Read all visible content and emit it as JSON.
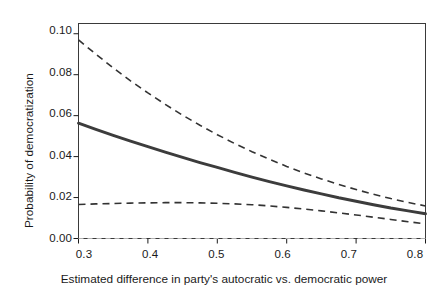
{
  "chart_data": {
    "type": "line",
    "title": "",
    "xlabel": "Estimated difference in party's autocratic vs. democratic power",
    "ylabel": "Probability of democratization",
    "xlim": [
      0.3,
      0.8
    ],
    "ylim": [
      0.0,
      0.105
    ],
    "grid": false,
    "legend": "none",
    "xticks": [
      0.3,
      0.4,
      0.5,
      0.6,
      0.7,
      0.8
    ],
    "xtick_labels": [
      "0.3",
      "0.4",
      "0.5",
      "0.6",
      "0.7",
      "0.8"
    ],
    "yticks": [
      0.0,
      0.02,
      0.04,
      0.06,
      0.08,
      0.1
    ],
    "ytick_labels": [
      "0.00",
      "0.02",
      "0.04",
      "0.06",
      "0.08",
      "0.10"
    ],
    "x": [
      0.3,
      0.325,
      0.35,
      0.375,
      0.4,
      0.425,
      0.45,
      0.475,
      0.5,
      0.525,
      0.55,
      0.575,
      0.6,
      0.625,
      0.65,
      0.675,
      0.7,
      0.725,
      0.75,
      0.775,
      0.8
    ],
    "series": [
      {
        "name": "upper-confidence-bound",
        "style": "dashed",
        "color": "#333333",
        "values": [
          0.097,
          0.09,
          0.0833,
          0.077,
          0.0711,
          0.0655,
          0.0602,
          0.0553,
          0.0507,
          0.0464,
          0.0424,
          0.0387,
          0.0352,
          0.032,
          0.0291,
          0.0264,
          0.0239,
          0.0216,
          0.0195,
          0.0176,
          0.0159
        ]
      },
      {
        "name": "predicted-probability",
        "style": "solid",
        "color": "#3c3c3c",
        "values": [
          0.0563,
          0.0533,
          0.0504,
          0.0476,
          0.0449,
          0.0422,
          0.0396,
          0.0371,
          0.0347,
          0.0323,
          0.03,
          0.0278,
          0.0257,
          0.0237,
          0.0218,
          0.0199,
          0.0182,
          0.0165,
          0.0149,
          0.0135,
          0.0121
        ]
      },
      {
        "name": "lower-confidence-bound",
        "style": "dashed",
        "color": "#333333",
        "values": [
          0.0166,
          0.0169,
          0.0171,
          0.0173,
          0.0174,
          0.0175,
          0.0175,
          0.0174,
          0.0172,
          0.0169,
          0.0165,
          0.0159,
          0.0152,
          0.0144,
          0.0135,
          0.0125,
          0.0115,
          0.0104,
          0.0093,
          0.0082,
          0.0071
        ]
      }
    ],
    "reference_line": {
      "name": "zero-reference-line",
      "y": 0.0,
      "style": "dashed",
      "color": "#b0b0b0"
    }
  },
  "axes": {
    "x_title": "Estimated difference in party's autocratic vs. democratic power",
    "y_title": "Probability of democratization",
    "x_tick_labels": [
      "0.3",
      "0.4",
      "0.5",
      "0.6",
      "0.7",
      "0.8"
    ],
    "y_tick_labels": [
      "0.00",
      "0.02",
      "0.04",
      "0.06",
      "0.08",
      "0.10"
    ]
  }
}
